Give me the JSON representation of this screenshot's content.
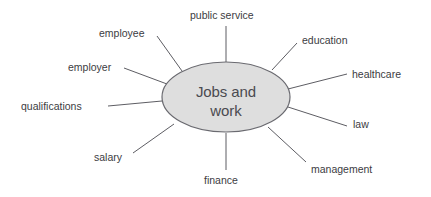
{
  "diagram": {
    "type": "mind-map",
    "center": {
      "label_line1": "Jobs and",
      "label_line2": "work",
      "full_label": "Jobs and work",
      "fill_color": "#dedede",
      "stroke_color": "#6a6a70",
      "cx": 226,
      "cy": 97,
      "rx": 64,
      "ry": 35
    },
    "line_color": "#5d5d63",
    "text_color": "#3c3c42",
    "background_color": "#ffffff",
    "branches": [
      {
        "id": "public-service",
        "label": "public service",
        "x": 190,
        "y": 10,
        "line": {
          "x1": 226,
          "y1": 62,
          "x2": 226,
          "y2": 26
        }
      },
      {
        "id": "employee",
        "label": "employee",
        "x": 99,
        "y": 28,
        "line": {
          "x1": 182,
          "y1": 71,
          "x2": 157,
          "y2": 36
        }
      },
      {
        "id": "employer",
        "label": "employer",
        "x": 68,
        "y": 62,
        "line": {
          "x1": 167,
          "y1": 84,
          "x2": 124,
          "y2": 68
        }
      },
      {
        "id": "qualifications",
        "label": "qualifications",
        "x": 21,
        "y": 101,
        "line": {
          "x1": 162,
          "y1": 101,
          "x2": 108,
          "y2": 106
        }
      },
      {
        "id": "salary",
        "label": "salary",
        "x": 94,
        "y": 152,
        "line": {
          "x1": 174,
          "y1": 124,
          "x2": 133,
          "y2": 153
        }
      },
      {
        "id": "finance",
        "label": "finance",
        "x": 204,
        "y": 175,
        "line": {
          "x1": 226,
          "y1": 133,
          "x2": 226,
          "y2": 170
        }
      },
      {
        "id": "education",
        "label": "education",
        "x": 302,
        "y": 35,
        "line": {
          "x1": 272,
          "y1": 70,
          "x2": 297,
          "y2": 43
        }
      },
      {
        "id": "healthcare",
        "label": "healthcare",
        "x": 352,
        "y": 69,
        "line": {
          "x1": 288,
          "y1": 89,
          "x2": 347,
          "y2": 74
        }
      },
      {
        "id": "law",
        "label": "law",
        "x": 353,
        "y": 119,
        "line": {
          "x1": 288,
          "y1": 107,
          "x2": 347,
          "y2": 126
        }
      },
      {
        "id": "management",
        "label": "management",
        "x": 311,
        "y": 164,
        "line": {
          "x1": 268,
          "y1": 127,
          "x2": 306,
          "y2": 162
        }
      }
    ]
  }
}
